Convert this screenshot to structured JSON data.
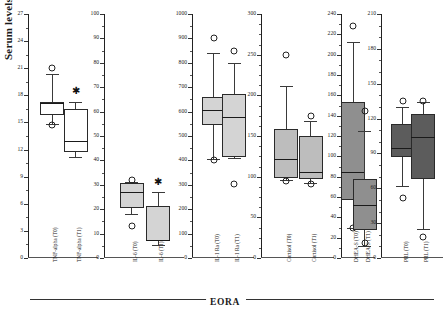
{
  "figure": {
    "ylabel": "Serum levels",
    "group_label": "EORA"
  },
  "chart_data": {
    "type": "box",
    "title": "",
    "ylabel": "Serum levels",
    "xlabel": "EORA",
    "grid": false,
    "legend": "none",
    "panels": [
      {
        "name": "TNF-alpha",
        "ylim": [
          0,
          27
        ],
        "ticks": [
          0,
          3,
          6,
          9,
          12,
          15,
          18,
          21,
          24,
          27
        ],
        "minor_step": 1.5,
        "fill": "#ffffff",
        "boxes": [
          {
            "label": "TNF-alpha (T0)",
            "min": 14.8,
            "q1": 15.8,
            "median": 17.2,
            "q3": 17.3,
            "max": 20.4,
            "outliers": [
              21.0,
              14.7
            ],
            "significant": false
          },
          {
            "label": "TNF-alpha (T1)",
            "min": 11.2,
            "q1": 11.7,
            "median": 13.0,
            "q3": 16.5,
            "max": 17.3,
            "outliers": [],
            "significant": true,
            "star_y": 18.5
          }
        ]
      },
      {
        "name": "IL-6",
        "ylim": [
          0,
          100
        ],
        "ticks": [
          0,
          10,
          20,
          30,
          40,
          50,
          60,
          70,
          80,
          90,
          100
        ],
        "minor_step": 5,
        "fill": "#d4d4d4",
        "boxes": [
          {
            "label": "IL-6 (T0)",
            "min": 18.0,
            "q1": 20.5,
            "median": 27.0,
            "q3": 30.8,
            "max": 31.2,
            "outliers": [
              31.8,
              13.0
            ],
            "significant": false
          },
          {
            "label": "IL-6 (T1)",
            "min": 5.5,
            "q1": 7.0,
            "median": 7.4,
            "q3": 21.5,
            "max": 27.0,
            "outliers": [],
            "significant": true,
            "star_y": 31.0
          }
        ]
      },
      {
        "name": "IL-1 Ra",
        "ylim": [
          0,
          1000
        ],
        "ticks": [
          0,
          100,
          200,
          300,
          400,
          500,
          600,
          700,
          800,
          900,
          1000
        ],
        "minor_step": 50,
        "fill": "#d4d4d4",
        "boxes": [
          {
            "label": "IL-1 Ra (T0)",
            "min": 405,
            "q1": 545,
            "median": 608,
            "q3": 660,
            "max": 840,
            "outliers": [
              900,
              400
            ],
            "significant": false
          },
          {
            "label": "IL-1 Ra (T1)",
            "min": 410,
            "q1": 412,
            "median": 578,
            "q3": 672,
            "max": 800,
            "outliers": [
              850,
              305
            ],
            "significant": false
          }
        ]
      },
      {
        "name": "Cortisol",
        "ylim": [
          0,
          300
        ],
        "ticks": [
          0,
          50,
          100,
          150,
          200,
          250,
          300
        ],
        "minor_step": 12.5,
        "fill": "#bdbdbd",
        "boxes": [
          {
            "label": "Cortisol (T0)",
            "min": 96,
            "q1": 98,
            "median": 122,
            "q3": 158,
            "max": 212,
            "outliers": [
              250,
              95
            ],
            "significant": false
          },
          {
            "label": "Cortisol (T1)",
            "min": 92,
            "q1": 97,
            "median": 106,
            "q3": 150,
            "max": 168,
            "outliers": [
              175,
              91
            ],
            "significant": false
          }
        ]
      },
      {
        "name": "DHEA-S",
        "ylim": [
          0,
          240
        ],
        "ticks": [
          0,
          20,
          40,
          60,
          80,
          100,
          120,
          140,
          160,
          180,
          200,
          220,
          240
        ],
        "minor_step": 10,
        "fill": "#8f8f8f",
        "boxes": [
          {
            "label": "DHEA-S (T0)",
            "min": 30,
            "q1": 57,
            "median": 85,
            "q3": 153,
            "max": 212,
            "outliers": [
              228,
              30
            ],
            "significant": false
          },
          {
            "label": "DHEA-S (T1)",
            "min": 12,
            "q1": 28,
            "median": 52,
            "q3": 78,
            "max": 125,
            "outliers": [
              145,
              15
            ],
            "significant": false
          }
        ]
      },
      {
        "name": "PRL",
        "ylim": [
          0,
          210
        ],
        "ticks": [
          0,
          30,
          60,
          90,
          120,
          150,
          180,
          210
        ],
        "minor_step": 10,
        "fill": "#5c5c5c",
        "boxes": [
          {
            "label": "PRL (T0)",
            "min": 62,
            "q1": 87,
            "median": 95,
            "q3": 115,
            "max": 130,
            "outliers": [
              135,
              52
            ],
            "significant": false
          },
          {
            "label": "PRL (T1)",
            "min": 25,
            "q1": 68,
            "median": 104,
            "q3": 124,
            "max": 134,
            "outliers": [
              135,
              18
            ],
            "significant": false
          }
        ]
      }
    ]
  }
}
